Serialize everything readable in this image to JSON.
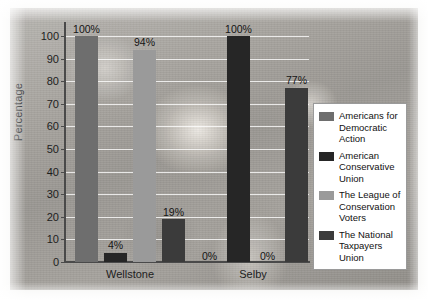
{
  "chart_data": {
    "type": "bar",
    "title": "",
    "subtitle": "",
    "xlabel": "",
    "ylabel": "Percentage",
    "ylim": [
      0,
      100
    ],
    "ytick_step": 10,
    "yticks": [
      100,
      90,
      80,
      70,
      60,
      50,
      40,
      30,
      20,
      10,
      0
    ],
    "grid": true,
    "grid_axis": "y",
    "legend_position": "right",
    "categories": [
      "Wellstone",
      "Selby"
    ],
    "series": [
      {
        "name": "Americans for Democratic Action",
        "legend_label": "Americans for Democratic Action",
        "color": "#6e6e6e",
        "values": [
          100,
          0
        ],
        "labels": [
          "100%",
          "0%"
        ]
      },
      {
        "name": "American Conservative Union",
        "legend_label": "American Conservative Union",
        "color": "#262626",
        "values": [
          4,
          100
        ],
        "labels": [
          "4%",
          "100%"
        ]
      },
      {
        "name": "The League of Conservation Voters",
        "legend_label": "The League of Conservation Voters",
        "color": "#9a9a9a",
        "values": [
          94,
          0
        ],
        "labels": [
          "94%",
          "0%"
        ]
      },
      {
        "name": "The National Taxpayers Union",
        "legend_label": "The National Taxpayers Union",
        "color": "#3b3b3b",
        "values": [
          19,
          77
        ],
        "labels": [
          "19%",
          "77%"
        ]
      }
    ]
  },
  "axis": {
    "y_label": "Percentage",
    "y_ticks": [
      "100",
      "90",
      "80",
      "70",
      "60",
      "50",
      "40",
      "30",
      "20",
      "10",
      "0"
    ]
  },
  "groups": [
    {
      "label": "Wellstone"
    },
    {
      "label": "Selby"
    }
  ],
  "bars": {
    "wellstone": [
      {
        "label": "100%",
        "value": 100,
        "color": "#6e6e6e",
        "series": "Americans for Democratic Action"
      },
      {
        "label": "4%",
        "value": 4,
        "color": "#262626",
        "series": "American Conservative Union"
      },
      {
        "label": "94%",
        "value": 94,
        "color": "#9a9a9a",
        "series": "The League of Conservation Voters"
      },
      {
        "label": "19%",
        "value": 19,
        "color": "#3b3b3b",
        "series": "The National Taxpayers Union"
      }
    ],
    "selby": [
      {
        "label": "0%",
        "value": 0,
        "color": "#6e6e6e",
        "series": "Americans for Democratic Action"
      },
      {
        "label": "100%",
        "value": 100,
        "color": "#262626",
        "series": "American Conservative Union"
      },
      {
        "label": "0%",
        "value": 0,
        "color": "#9a9a9a",
        "series": "The League of Conservation Voters"
      },
      {
        "label": "77%",
        "value": 77,
        "color": "#3b3b3b",
        "series": "The National Taxpayers Union"
      }
    ]
  },
  "legend": {
    "items": [
      {
        "label": "Americans for Democratic Action",
        "color": "#6e6e6e"
      },
      {
        "label": "American Conservative Union",
        "color": "#262626"
      },
      {
        "label": "The League of Conservation Voters",
        "color": "#9a9a9a"
      },
      {
        "label": "The National Taxpayers Union",
        "color": "#3b3b3b"
      }
    ]
  },
  "colors": {
    "ada": "#6e6e6e",
    "acu": "#262626",
    "lcv": "#9a9a9a",
    "ntu": "#3b3b3b",
    "axis": "#4a4a4a",
    "gridline": "#ffffff",
    "legend_border": "#9a9a9a",
    "legend_background": "#ffffff"
  }
}
